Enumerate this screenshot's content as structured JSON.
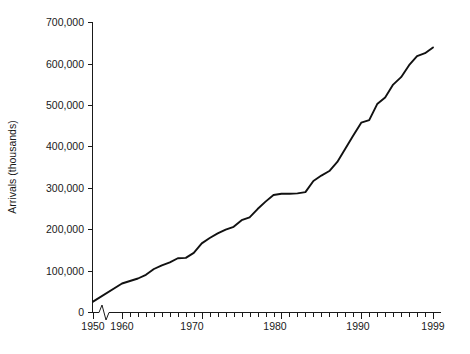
{
  "chart_data": {
    "type": "line",
    "title": "",
    "subtitle": "",
    "xlabel": "",
    "ylabel": "Arrivals (thousands)",
    "xlim": [
      1950,
      1999
    ],
    "ylim": [
      0,
      700000
    ],
    "grid": false,
    "legend": "none",
    "axis_break": {
      "present": true,
      "between": [
        1950,
        1960
      ],
      "note": "zigzag break on x-axis between 1950 and 1960"
    },
    "x_tick_labels": [
      "1950",
      "1960",
      "1970",
      "1980",
      "1990",
      "1999"
    ],
    "x_tick_values": [
      1950,
      1960,
      1970,
      1980,
      1990,
      1999
    ],
    "x_minor_tick_interval": 1,
    "y_tick_labels": [
      "0",
      "100,000",
      "200,000",
      "300,000",
      "400,000",
      "500,000",
      "600,000",
      "700,000"
    ],
    "y_tick_values": [
      0,
      100000,
      200000,
      300000,
      400000,
      500000,
      600000,
      700000
    ],
    "line_color": "#111111",
    "series": [
      {
        "name": "International tourist arrivals",
        "x": [
          1950,
          1960,
          1961,
          1962,
          1963,
          1964,
          1965,
          1966,
          1967,
          1968,
          1969,
          1970,
          1971,
          1972,
          1973,
          1974,
          1975,
          1976,
          1977,
          1978,
          1979,
          1980,
          1981,
          1982,
          1983,
          1984,
          1985,
          1986,
          1987,
          1988,
          1989,
          1990,
          1991,
          1992,
          1993,
          1994,
          1995,
          1996,
          1997,
          1998,
          1999
        ],
        "values": [
          25000,
          69000,
          75000,
          81000,
          90000,
          104000,
          113000,
          120000,
          130000,
          131000,
          143000,
          166000,
          179000,
          190000,
          199000,
          206000,
          222000,
          229000,
          249000,
          267000,
          283000,
          286000,
          286000,
          287000,
          290000,
          317000,
          330000,
          341000,
          363000,
          395000,
          427000,
          458000,
          464000,
          503000,
          519000,
          550000,
          568000,
          597000,
          619000,
          626000,
          640000
        ]
      }
    ]
  },
  "axes": {
    "y_title": "Arrivals (thousands)"
  }
}
